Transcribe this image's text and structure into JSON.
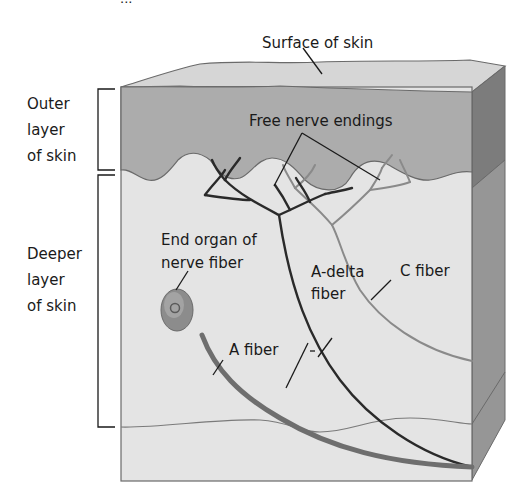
{
  "figure": {
    "clipped_header_text": "...",
    "labels": {
      "surface": "Surface of skin",
      "outer_layer": [
        "Outer",
        "layer",
        "of skin"
      ],
      "deeper_layer": [
        "Deeper",
        "layer",
        "of skin"
      ],
      "free_nerve_endings": "Free nerve endings",
      "end_organ": [
        "End organ of",
        "nerve fiber"
      ],
      "a_delta": [
        "A-delta",
        "fiber"
      ],
      "c_fiber": "C fiber",
      "a_fiber": "A fiber"
    },
    "colors": {
      "outer_layer": "#acacac",
      "deeper_layer": "#e4e4e4",
      "top_face": "#d6d6d6",
      "side_outer": "#7c7c7c",
      "side_deeper": "#969696",
      "a_fiber": "#6e6e6e",
      "a_delta_fiber": "#2a2a2a",
      "c_fiber": "#8a8a8a",
      "outline": "#6a6a6a"
    }
  }
}
